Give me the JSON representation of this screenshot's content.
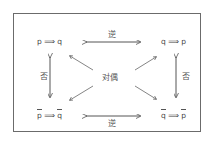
{
  "diagram": {
    "statements": {
      "original": {
        "p": "p",
        "arrow": "⟹",
        "q": "q",
        "negated": false
      },
      "converse": {
        "p": "q",
        "arrow": "⟹",
        "q": "p",
        "negated": false
      },
      "inverse": {
        "p": "p",
        "arrow": "⟹",
        "q": "q",
        "negated": true
      },
      "contrapositive": {
        "p": "q",
        "arrow": "⟹",
        "q": "p",
        "negated": true
      }
    },
    "relations": {
      "top": "逆",
      "bottom": "逆",
      "left": "否",
      "right": "否",
      "center": "对偶"
    },
    "colors": {
      "frame": "#6b6b6b",
      "arrow": "#555555",
      "text": "#444444"
    }
  }
}
